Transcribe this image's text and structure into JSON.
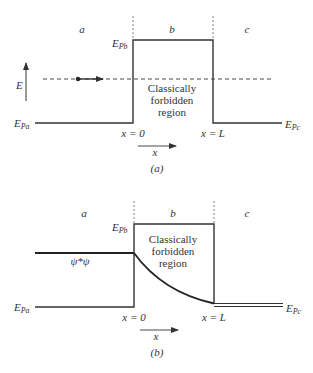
{
  "panel_a": {
    "caption": "(a)",
    "region_labels": [
      "a",
      "b",
      "c"
    ],
    "barrier_label_main": "E",
    "barrier_label_sub": "Pb",
    "left_level_main": "E",
    "left_level_sub": "Pa",
    "right_level_main": "E",
    "right_level_sub": "Pc",
    "energy_axis_label": "E",
    "x_axis_label": "x",
    "x0_label": "x = 0",
    "xL_label": "x = L",
    "forbidden_line1": "Classically",
    "forbidden_line2": "forbidden",
    "forbidden_line3": "region"
  },
  "panel_b": {
    "caption": "(b)",
    "region_labels": [
      "a",
      "b",
      "c"
    ],
    "barrier_label_main": "E",
    "barrier_label_sub": "Pb",
    "left_level_main": "E",
    "left_level_sub": "Pa",
    "right_level_main": "E",
    "right_level_sub": "Pc",
    "x_axis_label": "x",
    "x0_label": "x = 0",
    "xL_label": "x = L",
    "psi_label": "ψ*ψ",
    "forbidden_line1": "Classically",
    "forbidden_line2": "forbidden",
    "forbidden_line3": "region"
  },
  "colors": {
    "line": "#333333",
    "thin_line": "#555555"
  }
}
